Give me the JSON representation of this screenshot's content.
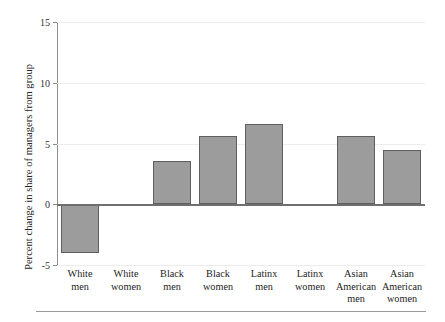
{
  "chart_data": {
    "type": "bar",
    "title": "",
    "subtitle": "",
    "xlabel": "",
    "ylabel": "Percent change in share of managers from group",
    "categories": [
      "White men",
      "White women",
      "Black men",
      "Black women",
      "Latinx men",
      "Latinx women",
      "Asian American men",
      "Asian American women"
    ],
    "category_lines": [
      [
        "White",
        "men"
      ],
      [
        "White",
        "women"
      ],
      [
        "Black",
        "men"
      ],
      [
        "Black",
        "women"
      ],
      [
        "Latinx",
        "men"
      ],
      [
        "Latinx",
        "women"
      ],
      [
        "Asian",
        "American",
        "men"
      ],
      [
        "Asian",
        "American",
        "women"
      ]
    ],
    "values": [
      -4.0,
      0,
      3.6,
      5.65,
      6.6,
      0,
      5.6,
      4.45
    ],
    "ylim": [
      -5,
      15
    ],
    "yticks": [
      15,
      10,
      5,
      0,
      -5
    ],
    "ytick_labels": [
      "15",
      "10",
      "5",
      "0",
      "-5"
    ],
    "grid": true,
    "grid_axis": "y",
    "legend": false,
    "legend_position": "none",
    "bar_color": "#9c9c9c",
    "bar_edge_color": "#5f5f5f",
    "gridline_color": "#ececec",
    "axis_color": "#8e8e8e",
    "zero_line_color": "#6f6f6f"
  }
}
